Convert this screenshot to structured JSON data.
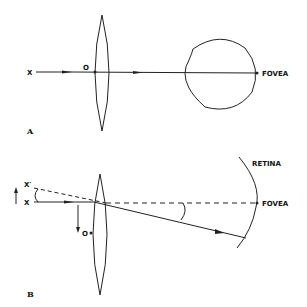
{
  "panel_a": {
    "panel_label": "A",
    "object_label": "X",
    "nodal_point_label": "O",
    "fovea_label": "FOVEA"
  },
  "panel_b": {
    "panel_label": "B",
    "object_label": "X",
    "displaced_object_label": "X′",
    "nodal_point_label": "O",
    "retina_label": "RETINA",
    "fovea_label": "FOVEA"
  },
  "colors": {
    "line": "#222222",
    "background": "#ffffff"
  }
}
